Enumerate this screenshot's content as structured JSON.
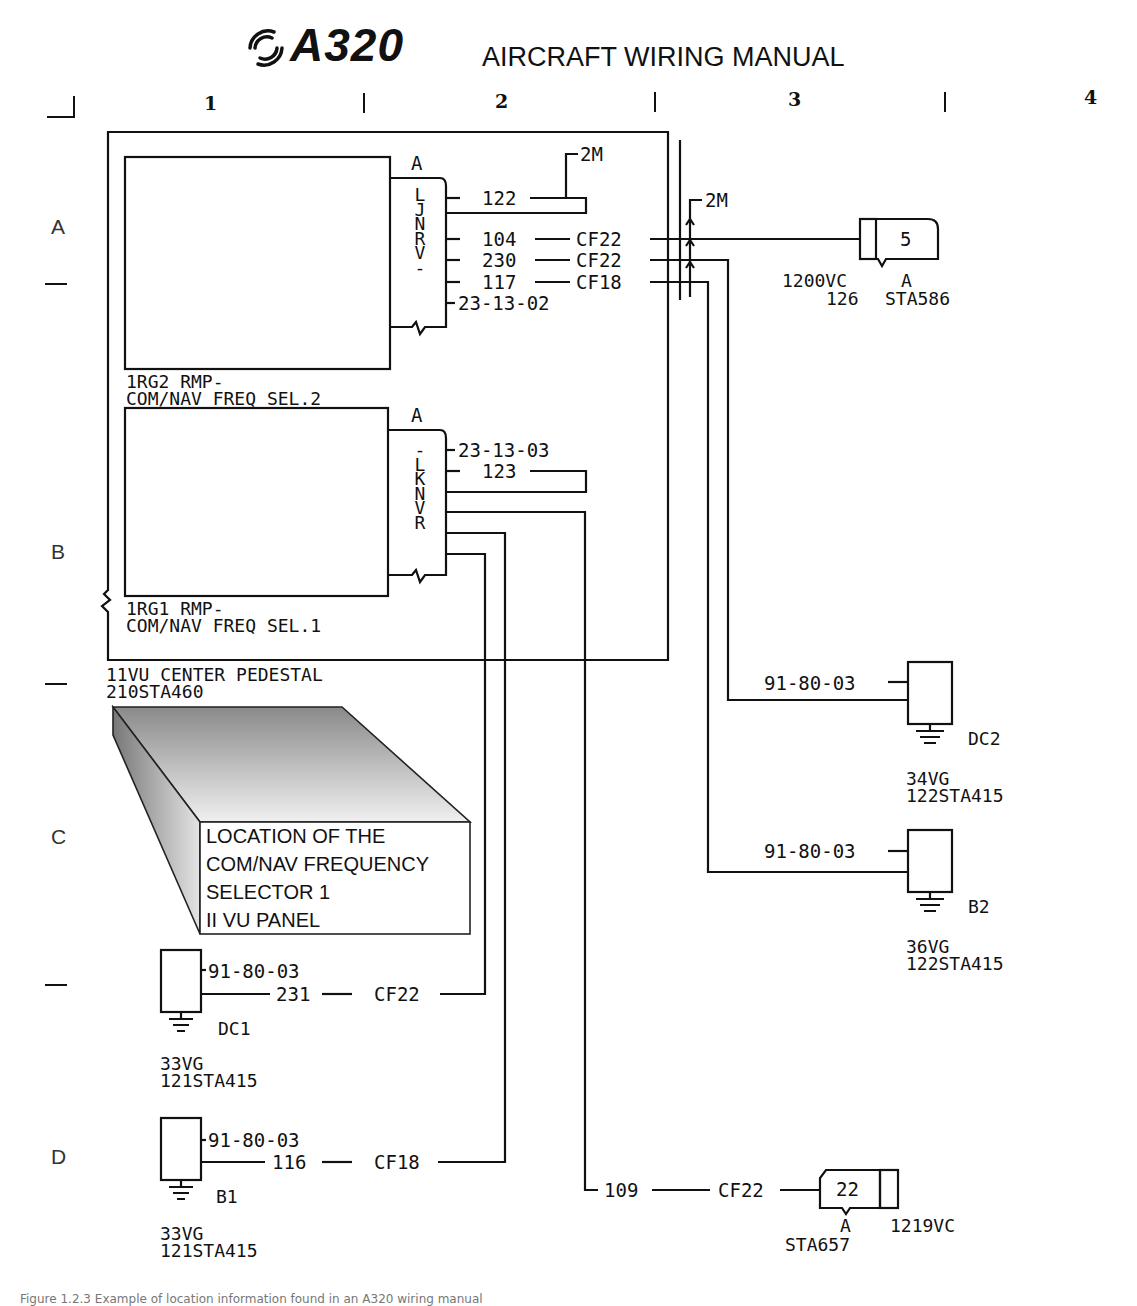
{
  "header": {
    "logo": "A320",
    "title": "AIRCRAFT WIRING MANUAL"
  },
  "grid": {
    "columns": [
      "1",
      "2",
      "3",
      "4"
    ],
    "rows": [
      "A",
      "B",
      "C",
      "D"
    ]
  },
  "panel": {
    "label_line1": "11VU  CENTER PEDESTAL",
    "label_line2": "210STA460"
  },
  "rmp2": {
    "label_line1": "1RG2  RMP-",
    "label_line2": "COM/NAV FREQ SEL.2",
    "connector": "A",
    "pins": [
      "L",
      "J",
      "N",
      "R",
      "V",
      "-"
    ],
    "wires": [
      {
        "wire": "122",
        "gauge": ""
      },
      {
        "wire": "104",
        "gauge": "CF22"
      },
      {
        "wire": "230",
        "gauge": "CF22"
      },
      {
        "wire": "117",
        "gauge": "CF18"
      }
    ],
    "ref": "23-13-02",
    "shield": "2M"
  },
  "rmp1": {
    "label_line1": "1RG1  RMP-",
    "label_line2": "COM/NAV FREQ SEL.1",
    "connector": "A",
    "pins": [
      "-",
      "L",
      "K",
      "N",
      "V",
      "R"
    ],
    "ref": "23-13-03",
    "wire": "123"
  },
  "shield2": "2M",
  "conn_top": {
    "pin": "5",
    "id": "1200VC",
    "conn": "A",
    "zone": "126",
    "station": "STA586"
  },
  "ground_dc2": {
    "ref": "91-80-03",
    "name": "DC2",
    "id": "34VG",
    "location": "122STA415"
  },
  "ground_b2": {
    "ref": "91-80-03",
    "name": "B2",
    "id": "36VG",
    "location": "122STA415"
  },
  "ground_dc1": {
    "ref": "91-80-03",
    "wire": "231",
    "gauge": "CF22",
    "name": "DC1",
    "id": "33VG",
    "location": "121STA415"
  },
  "ground_b1": {
    "ref": "91-80-03",
    "wire": "116",
    "gauge": "CF18",
    "name": "B1",
    "id": "33VG",
    "location": "121STA415"
  },
  "conn_bottom": {
    "wire": "109",
    "gauge": "CF22",
    "pin": "22",
    "conn": "A",
    "id": "1219VC",
    "station": "STA657"
  },
  "location_box": {
    "lines": [
      "LOCATION OF THE",
      "COM/NAV FREQUENCY",
      "SELECTOR 1",
      "II VU PANEL"
    ]
  },
  "caption": "Figure 1.2.3 Example of location information found in an A320 wiring manual"
}
